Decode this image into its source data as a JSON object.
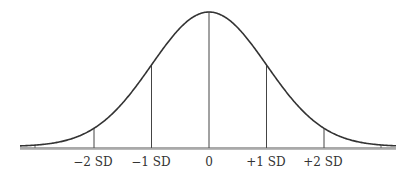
{
  "chart_data": {
    "type": "line",
    "title": "",
    "xlabel": "",
    "ylabel": "",
    "x_ticks": [
      {
        "value": -2,
        "label": "−2 SD"
      },
      {
        "value": -1,
        "label": "−1 SD"
      },
      {
        "value": 0,
        "label": "0"
      },
      {
        "value": 1,
        "label": "+1 SD"
      },
      {
        "value": 2,
        "label": "+2 SD"
      }
    ],
    "xlim": [
      -3.3,
      3.3
    ],
    "ylim": [
      0,
      1
    ],
    "series": [
      {
        "name": "normal density (relative to peak)",
        "x": [
          -3,
          -2.5,
          -2,
          -1.5,
          -1,
          -0.5,
          0,
          0.5,
          1,
          1.5,
          2,
          2.5,
          3
        ],
        "values": [
          0.011,
          0.044,
          0.135,
          0.325,
          0.607,
          0.882,
          1.0,
          0.882,
          0.607,
          0.325,
          0.135,
          0.044,
          0.011
        ]
      }
    ],
    "reference_lines": [
      -2,
      -1,
      0,
      1,
      2
    ],
    "grid": false,
    "legend": "none",
    "colors": {
      "curve": "#333333",
      "axis": "#555555",
      "labels": "#333333"
    }
  }
}
